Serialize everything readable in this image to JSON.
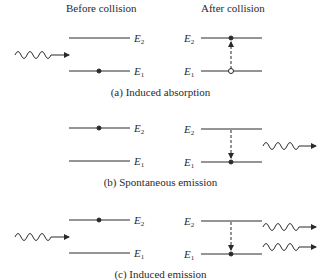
{
  "headers": {
    "before": "Before collision",
    "after": "After collision"
  },
  "levels": {
    "upper": "E",
    "upper_sub": "2",
    "lower": "E",
    "lower_sub": "1"
  },
  "panels": [
    {
      "id": "a",
      "caption": "(a) Induced absorption",
      "before_electron": "E1",
      "after_electron": "E2",
      "transition": "up",
      "photons_in": 1,
      "photons_out": 0
    },
    {
      "id": "b",
      "caption": "(b) Spontaneous emission",
      "before_electron": "E2",
      "after_electron": "E1",
      "transition": "down",
      "photons_in": 0,
      "photons_out": 1
    },
    {
      "id": "c",
      "caption": "(c) Induced emission",
      "before_electron": "E2",
      "after_electron": "E1",
      "transition": "down",
      "photons_in": 1,
      "photons_out": 2
    }
  ]
}
